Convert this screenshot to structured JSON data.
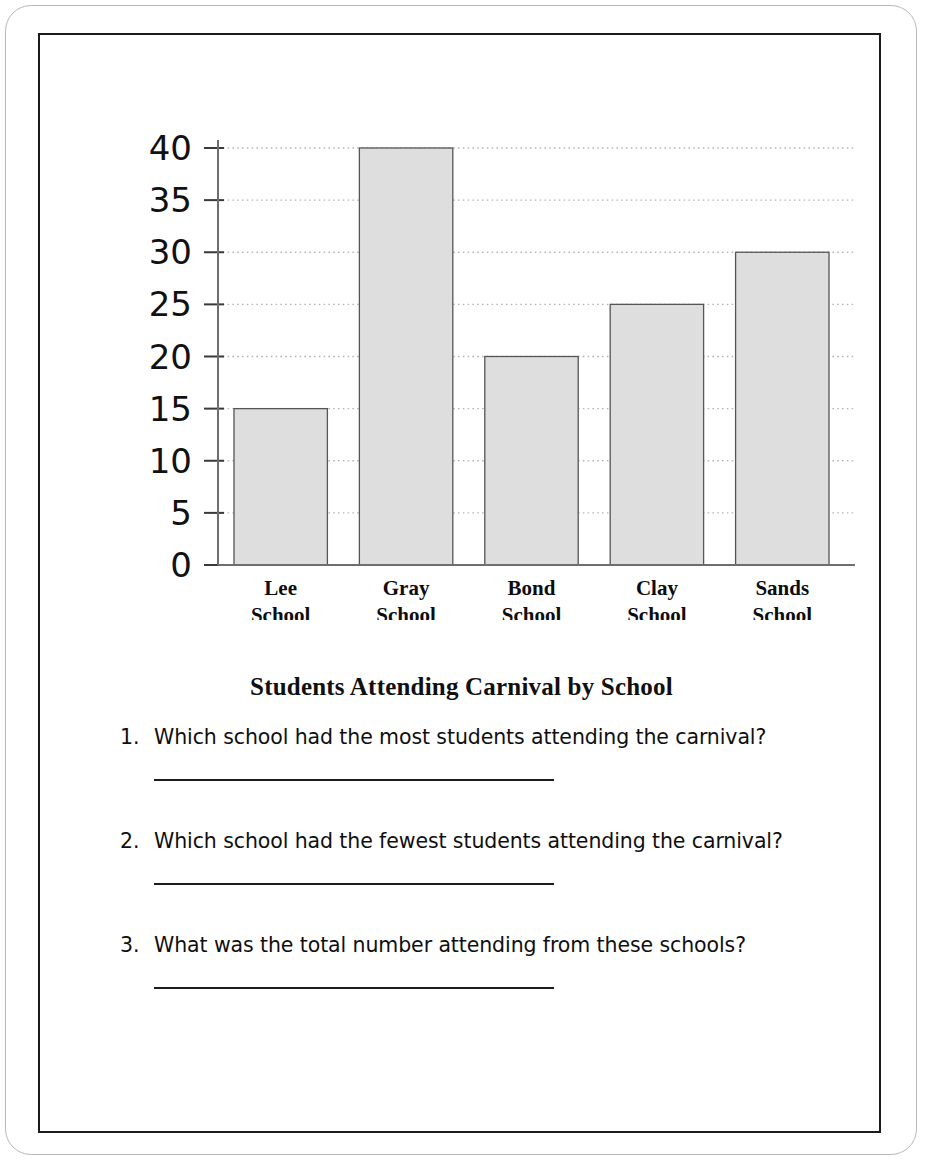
{
  "worksheet": {
    "title": "Students Attending Carnival by School"
  },
  "chart_data": {
    "type": "bar",
    "title": "Students Attending Carnival by School",
    "xlabel": "",
    "ylabel": "",
    "categories": [
      "Lee School",
      "Gray School",
      "Bond School",
      "Clay School",
      "Sands School"
    ],
    "category_lines": [
      [
        "Lee",
        "School"
      ],
      [
        "Gray",
        "School"
      ],
      [
        "Bond",
        "School"
      ],
      [
        "Clay",
        "School"
      ],
      [
        "Sands",
        "School"
      ]
    ],
    "values": [
      15,
      40,
      20,
      25,
      30
    ],
    "ylim": [
      0,
      40
    ],
    "ytick_step": 5,
    "yticks": [
      0,
      5,
      10,
      15,
      20,
      25,
      30,
      35,
      40
    ],
    "ytick_labels": [
      "0",
      "5",
      "10",
      "15",
      "20",
      "25",
      "30",
      "35",
      "40"
    ],
    "grid": true,
    "grid_style": "dotted",
    "legend": "none",
    "bar_fill_color": "#dedede",
    "bar_edge_color": "#555555",
    "axis_color": "#6e6e6e",
    "grid_color": "#b5b5b5"
  },
  "questions": [
    {
      "number": "1.",
      "text": "Which school had the most students attending the carnival?",
      "answer": ""
    },
    {
      "number": "2.",
      "text": "Which school had the fewest students attending the carnival?",
      "answer": ""
    },
    {
      "number": "3.",
      "text": "What was the total number attending from these schools?",
      "answer": ""
    }
  ]
}
